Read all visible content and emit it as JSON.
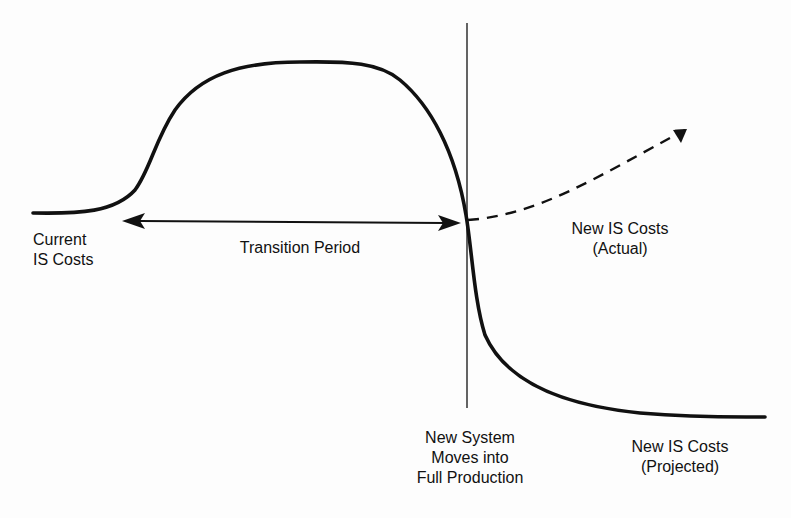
{
  "diagram": {
    "type": "cost-curve-over-time",
    "colors": {
      "ink": "#111111",
      "background": "#fdfdfd"
    },
    "labels": {
      "current_costs": [
        "Current",
        "IS Costs"
      ],
      "transition_period": "Transition Period",
      "new_costs_actual": [
        "New IS Costs",
        "(Actual)"
      ],
      "full_production": [
        "New System",
        "Moves into",
        "Full Production"
      ],
      "new_costs_projected": [
        "New IS Costs",
        "(Projected)"
      ]
    },
    "elements": [
      {
        "id": "cost-curve",
        "style": "solid-thick",
        "description": "Starts flat at current IS costs, rises to a plateau during transition, then drops through the production marker to a low flat projected cost level"
      },
      {
        "id": "actual-cost-arrow",
        "style": "dashed-arrow",
        "description": "From the production marker, dashed line rising upward to the right indicating actual new IS costs"
      },
      {
        "id": "transition-arrow",
        "style": "double-headed-arrow",
        "description": "Horizontal span covering the transition period"
      },
      {
        "id": "production-marker",
        "style": "thin-vertical-line",
        "description": "Point where new system moves into full production"
      }
    ]
  }
}
